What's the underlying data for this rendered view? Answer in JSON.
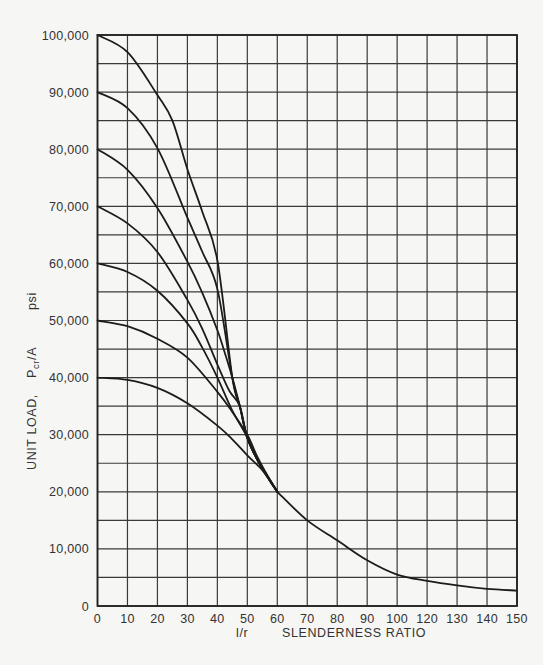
{
  "chart_data": {
    "type": "line",
    "title": "",
    "xlabel": "l/r   SLENDERNESS RATIO",
    "xlabel_parts": {
      "symbol": "l/r",
      "text": "SLENDERNESS RATIO"
    },
    "ylabel": "UNIT LOAD,  Pcr/A  psi",
    "ylabel_parts": {
      "prefix": "UNIT LOAD,",
      "symbol_main": "P",
      "symbol_sub": "cr",
      "symbol_tail": "/A",
      "unit": "psi"
    },
    "x_tick_labels": [
      "0",
      "10",
      "20",
      "30",
      "40",
      "50",
      "60",
      "70",
      "80",
      "90",
      "100",
      "120",
      "130",
      "140",
      "150"
    ],
    "x_tick_positions": [
      0,
      10,
      20,
      30,
      40,
      50,
      60,
      70,
      80,
      90,
      100,
      110,
      120,
      130,
      140
    ],
    "y_tick_labels": [
      "0",
      "10,000",
      "20,000",
      "30,000",
      "40,000",
      "50,000",
      "60,000",
      "70,000",
      "80,000",
      "90,000",
      "100,000"
    ],
    "y_tick_values": [
      0,
      10000,
      20000,
      30000,
      40000,
      50000,
      60000,
      70000,
      80000,
      90000,
      100000
    ],
    "xlim": [
      0,
      140
    ],
    "ylim": [
      0,
      100000
    ],
    "grid": {
      "on": true,
      "x_step": 10,
      "y_step": 5000
    },
    "legend": null,
    "series": [
      {
        "name": "100,000 psi",
        "x": [
          0,
          10,
          20,
          25,
          30,
          35,
          40,
          45,
          47.5,
          50,
          54,
          60
        ],
        "y": [
          100000,
          97000,
          89500,
          85000,
          76500,
          69000,
          60500,
          40000,
          35000,
          29500,
          25000,
          20000
        ]
      },
      {
        "name": "90,000 psi",
        "x": [
          0,
          10,
          20,
          30,
          35,
          40,
          45,
          47.5,
          50,
          54,
          60
        ],
        "y": [
          90000,
          87200,
          80200,
          68000,
          62000,
          55500,
          40000,
          35000,
          29500,
          25000,
          20000
        ]
      },
      {
        "name": "80,000 psi",
        "x": [
          0,
          10,
          20,
          30,
          35,
          40,
          43,
          45,
          47.5,
          50,
          54,
          60
        ],
        "y": [
          80000,
          76400,
          69700,
          60300,
          54800,
          48300,
          43500,
          40000,
          35000,
          29500,
          25000,
          20000
        ]
      },
      {
        "name": "70,000 psi",
        "x": [
          0,
          10,
          20,
          30,
          35,
          40,
          44,
          47.5,
          50,
          54,
          60
        ],
        "y": [
          70000,
          67000,
          62000,
          53600,
          48500,
          42300,
          37700,
          35000,
          29500,
          25000,
          20000
        ]
      },
      {
        "name": "60,000 psi",
        "x": [
          0,
          10,
          20,
          30,
          35,
          40,
          45,
          49.5,
          54,
          60
        ],
        "y": [
          60000,
          58500,
          55200,
          49500,
          45200,
          40000,
          34200,
          30000,
          25000,
          20000
        ]
      },
      {
        "name": "50,000 psi",
        "x": [
          0,
          10,
          20,
          30,
          40,
          45,
          50,
          53,
          56,
          60
        ],
        "y": [
          50000,
          49000,
          46800,
          43500,
          37500,
          34000,
          30000,
          26500,
          23500,
          20000
        ]
      },
      {
        "name": "40,000 psi",
        "x": [
          0,
          10,
          20,
          30,
          40,
          45,
          50,
          55,
          58,
          60
        ],
        "y": [
          40000,
          39600,
          38200,
          35500,
          31600,
          29200,
          26400,
          23800,
          21500,
          20000
        ]
      },
      {
        "name": "common tail",
        "x": [
          60,
          70,
          80,
          90,
          100,
          110,
          120,
          130,
          140
        ],
        "y": [
          20000,
          15000,
          11500,
          8000,
          5500,
          4400,
          3600,
          3000,
          2700
        ]
      }
    ]
  }
}
